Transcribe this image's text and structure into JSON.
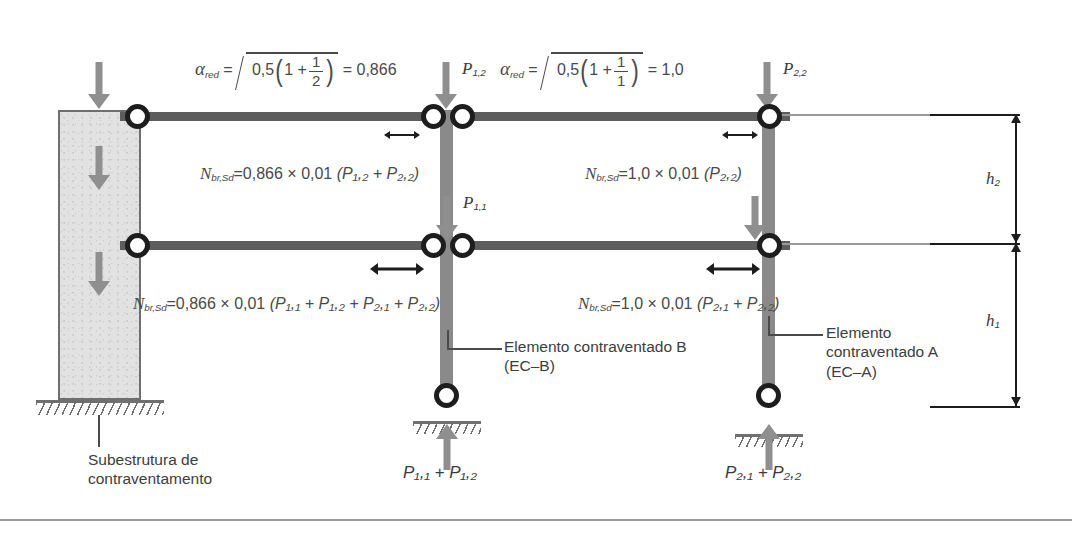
{
  "figure": {
    "language": "pt-BR"
  },
  "colors": {
    "wall_fill": "#e2e2e2",
    "wall_stroke": "#6f6f6f",
    "column": "#8a8a8a",
    "beam": "#5d5d5d",
    "hinge_stroke": "#1d1d1d",
    "arrow_gray": "#8f8f8f",
    "arrow_dark": "#1d1d1d",
    "text": "#3b3b3b",
    "ground": "#6f6f6f"
  },
  "formulas": {
    "alpha_red_B": {
      "symbol": "α",
      "symbol_sub": "red",
      "equals": "=",
      "radicand_lead": "0,5",
      "paren_open": "(",
      "inner_lead": "1 +",
      "frac_num": "1",
      "frac_den": "2",
      "paren_close": ")",
      "result_equals": "=",
      "result": "0,866"
    },
    "alpha_red_A": {
      "symbol": "α",
      "symbol_sub": "red",
      "equals": "=",
      "radicand_lead": "0,5",
      "paren_open": "(",
      "inner_lead": "1 +",
      "frac_num": "1",
      "frac_den": "1",
      "paren_close": ")",
      "result_equals": "=",
      "result": "1,0"
    },
    "nbr_top_left": {
      "symbol": "N",
      "symbol_sub": "br,Sd",
      "equals": "=",
      "factor": "0,866",
      "times": "×",
      "coefficient": "0,01",
      "terms": "(P₁,₂ + P₂,₂)",
      "plain": "N_br,Sd = 0,866 × 0,01 (P1,2 + P2,2)"
    },
    "nbr_top_right": {
      "symbol": "N",
      "symbol_sub": "br,Sd",
      "equals": "=",
      "factor": "1,0",
      "times": "×",
      "coefficient": "0,01",
      "terms": "(P₂,₂)",
      "plain": "N_br,Sd = 1,0 × 0,01 (P2,2)"
    },
    "nbr_bottom_left": {
      "symbol": "N",
      "symbol_sub": "br,Sd",
      "equals": "=",
      "factor": "0,866",
      "times": "×",
      "coefficient": "0,01",
      "terms": "(P₁,₁ + P₁,₂ + P₂,₁ + P₂,₂)",
      "plain": "N_br,Sd = 0,866 × 0,01 (P1,1 + P1,2 + P2,1 + P2,2)"
    },
    "nbr_bottom_right": {
      "symbol": "N",
      "symbol_sub": "br,Sd",
      "equals": "=",
      "factor": "1,0",
      "times": "×",
      "coefficient": "0,01",
      "terms": "(P₂,₁ + P₂,₂)",
      "plain": "N_br,Sd = 1,0 × 0,01 (P2,1 + P2,2)"
    }
  },
  "loads": {
    "p12": {
      "symbol": "P",
      "sub": "1,2"
    },
    "p22": {
      "symbol": "P",
      "sub": "2,2"
    },
    "p11": {
      "symbol": "P",
      "sub": "1,1"
    },
    "reaction_b": "P₁,₁ + P₁,₂",
    "reaction_a": "P₂,₁ + P₂,₂"
  },
  "dimensions": {
    "h2": {
      "symbol": "h",
      "sub": "2"
    },
    "h1": {
      "symbol": "h",
      "sub": "1"
    }
  },
  "labels": {
    "substructure": {
      "line1": "Subestrutura de",
      "line2": "contraventamento"
    },
    "element_b": {
      "line1": "Elemento contraventado B",
      "line2": "(EC–B)"
    },
    "element_a": {
      "line1": "Elemento",
      "line2": "contraventado A",
      "line3": "(EC–A)"
    }
  }
}
